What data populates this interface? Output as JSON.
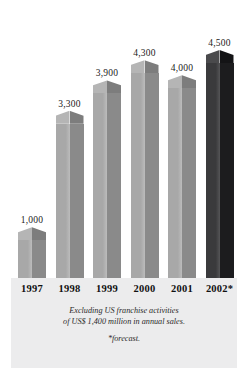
{
  "chart_data": {
    "type": "bar",
    "title": "",
    "subtitle": "",
    "xlabel": "",
    "ylabel": "",
    "categories": [
      "1997",
      "1998",
      "1999",
      "2000",
      "2001",
      "2002*"
    ],
    "values": [
      1000,
      3300,
      3900,
      4300,
      4000,
      4500
    ],
    "value_labels": [
      "1,000",
      "3,300",
      "3,900",
      "4,300",
      "4,000",
      "4,500"
    ],
    "ylim": [
      0,
      4500
    ],
    "grid": false,
    "legend": null,
    "style": "3d-obelisk-bars",
    "highlight_index": 5,
    "highlight_reason": "forecast",
    "annotations": [
      "Excluding US franchise activities",
      "of US$ 1,400 million in annual sales.",
      "*forecast."
    ]
  },
  "footer": {
    "note_line_1": "Excluding US franchise activities",
    "note_line_2": "of US$ 1,400 million in annual sales.",
    "forecast_note": "*forecast."
  },
  "colors": {
    "bar_left_face": "#a8a8a8",
    "bar_right_face": "#8a8a8a",
    "bar_cap_left": "#b5b5b5",
    "bar_cap_right": "#7d7d7d",
    "forecast_left_face": "#3a3a3c",
    "forecast_right_face": "#1c1c1e",
    "forecast_cap_left": "#4a4a4c",
    "forecast_cap_right": "#141416",
    "panel_background": "#ececed",
    "page_background": "#ffffff",
    "label_text": "#1a1a1a"
  }
}
